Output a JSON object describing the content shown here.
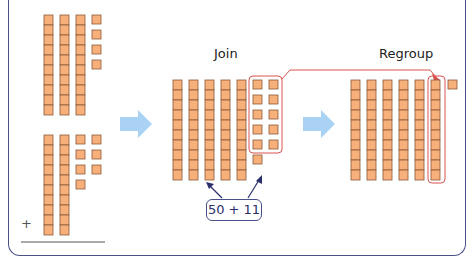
{
  "labels": {
    "join": "Join",
    "regroup": "Regroup",
    "expression": "50 + 11",
    "plus_sign": "+"
  },
  "addends": {
    "top": {
      "tens": 3,
      "ones": 4
    },
    "bottom": {
      "tens": 2,
      "ones": 7
    }
  },
  "join_group": {
    "tens": 5,
    "ones": 11
  },
  "regroup_group": {
    "tens": 6,
    "ones": 1
  },
  "colors": {
    "block_fill": "#f7b07a",
    "block_stroke": "#8a5a3a",
    "arrow_fill": "#a9d2f5",
    "highlight": "#d9534f",
    "frame": "#4a4f8a",
    "callout": "#2b2f6b"
  }
}
